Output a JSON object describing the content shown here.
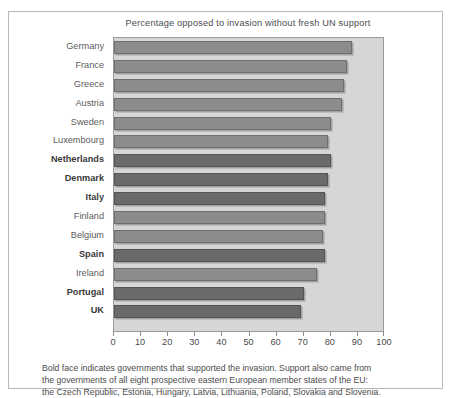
{
  "chart_data": {
    "type": "bar",
    "orientation": "horizontal",
    "title": "Percentage opposed to invasion without fresh UN support",
    "xlabel": "",
    "ylabel": "",
    "xlim": [
      0,
      100
    ],
    "xticks": [
      0,
      10,
      20,
      30,
      40,
      50,
      60,
      70,
      80,
      90,
      100
    ],
    "xtick_labels": [
      "0",
      "10",
      "20",
      "30",
      "40",
      "50",
      "60",
      "70",
      "80",
      "90",
      "100"
    ],
    "grid": false,
    "legend": null,
    "categories": [
      "Germany",
      "France",
      "Greece",
      "Austria",
      "Sweden",
      "Luxembourg",
      "Netherlands",
      "Denmark",
      "Italy",
      "Finland",
      "Belgium",
      "Spain",
      "Ireland",
      "Portugal",
      "UK"
    ],
    "values": [
      88,
      86,
      85,
      84,
      80,
      79,
      80,
      79,
      78,
      78,
      77,
      78,
      75,
      70,
      69
    ],
    "bold_categories": [
      "Netherlands",
      "Denmark",
      "Italy",
      "Spain",
      "Portugal",
      "UK"
    ],
    "bars": [
      {
        "label": "Germany",
        "value": 88,
        "bold": false
      },
      {
        "label": "France",
        "value": 86,
        "bold": false
      },
      {
        "label": "Greece",
        "value": 85,
        "bold": false
      },
      {
        "label": "Austria",
        "value": 84,
        "bold": false
      },
      {
        "label": "Sweden",
        "value": 80,
        "bold": false
      },
      {
        "label": "Luxembourg",
        "value": 79,
        "bold": false
      },
      {
        "label": "Netherlands",
        "value": 80,
        "bold": true
      },
      {
        "label": "Denmark",
        "value": 79,
        "bold": true
      },
      {
        "label": "Italy",
        "value": 78,
        "bold": true
      },
      {
        "label": "Finland",
        "value": 78,
        "bold": false
      },
      {
        "label": "Belgium",
        "value": 77,
        "bold": false
      },
      {
        "label": "Spain",
        "value": 78,
        "bold": true
      },
      {
        "label": "Ireland",
        "value": 75,
        "bold": false
      },
      {
        "label": "Portugal",
        "value": 70,
        "bold": true
      },
      {
        "label": "UK",
        "value": 69,
        "bold": true
      }
    ],
    "colors": {
      "plot_background": "#d6d6d6",
      "bar_normal": "#8c8c8c",
      "bar_bold": "#6a6a6a",
      "text": "#4c4c4c",
      "frame": "#b9b9b9"
    }
  },
  "footnote": {
    "line1": "Bold face indicates governments that supported the invasion. Support also came from",
    "line2": "the governments of all eight prospective eastern European member states of the EU:",
    "line3": "the Czech Republic, Estonia, Hungary, Latvia, Lithuania, Poland, Slovakia and Slovenia."
  }
}
